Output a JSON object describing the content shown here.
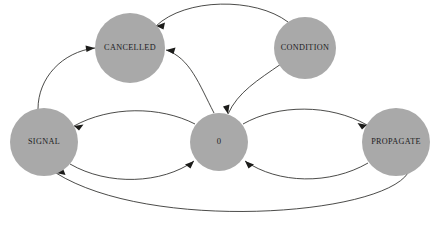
{
  "diagram": {
    "type": "state-transition-graph",
    "title": "",
    "background_color": "#ffffff",
    "node_fill_color": "#a9a9a9",
    "edge_color": "#2a2a28",
    "label_color": "#20201e",
    "nodes": [
      {
        "id": "cancelled",
        "label": "CANCELLED",
        "cx": 130,
        "cy": 48,
        "r": 35
      },
      {
        "id": "condition",
        "label": "CONDITION",
        "cx": 305,
        "cy": 48,
        "r": 31
      },
      {
        "id": "signal",
        "label": "SIGNAL",
        "cx": 44,
        "cy": 142,
        "r": 34
      },
      {
        "id": "zero",
        "label": "0",
        "cx": 219,
        "cy": 142,
        "r": 29
      },
      {
        "id": "propagate",
        "label": "PROPAGATE",
        "cx": 396,
        "cy": 142,
        "r": 34
      }
    ],
    "edges": [
      {
        "id": "condition-to-cancelled",
        "from": "CONDITION",
        "to": "CANCELLED",
        "directed": true
      },
      {
        "id": "zero-to-cancelled",
        "from": "0",
        "to": "CANCELLED",
        "directed": true
      },
      {
        "id": "signal-to-cancelled",
        "from": "SIGNAL",
        "to": "CANCELLED",
        "directed": true
      },
      {
        "id": "condition-to-zero",
        "from": "CONDITION",
        "to": "0",
        "directed": true
      },
      {
        "id": "zero-to-signal",
        "from": "0",
        "to": "SIGNAL",
        "directed": true
      },
      {
        "id": "signal-to-zero",
        "from": "SIGNAL",
        "to": "0",
        "directed": true
      },
      {
        "id": "zero-to-propagate",
        "from": "0",
        "to": "PROPAGATE",
        "directed": true
      },
      {
        "id": "propagate-to-zero",
        "from": "PROPAGATE",
        "to": "0",
        "directed": true
      },
      {
        "id": "propagate-to-signal",
        "from": "PROPAGATE",
        "to": "SIGNAL",
        "directed": true
      }
    ]
  }
}
